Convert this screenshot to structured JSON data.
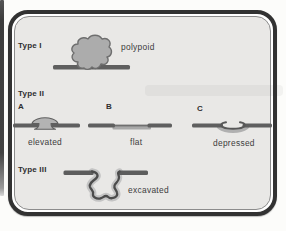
{
  "figure": {
    "kind": "lesion-type-classification-diagram",
    "sections": [
      {
        "label": "Type I",
        "descriptor": "polypoid"
      },
      {
        "label": "Type II",
        "variants": [
          {
            "letter": "A",
            "descriptor": "elevated"
          },
          {
            "letter": "B",
            "descriptor": "flat"
          },
          {
            "letter": "C",
            "descriptor": "depressed"
          }
        ]
      },
      {
        "label": "Type III",
        "descriptor": "excavated"
      }
    ],
    "colors": {
      "frame_border": "#323232",
      "panel_background": "#e9e8e6",
      "page_background": "#fcfcfa",
      "mucosa_line": "#5f5f5f",
      "lesion_fill": "#acacac",
      "halo_gray": "#c4c4c4",
      "text": "#2e2e2e"
    }
  }
}
